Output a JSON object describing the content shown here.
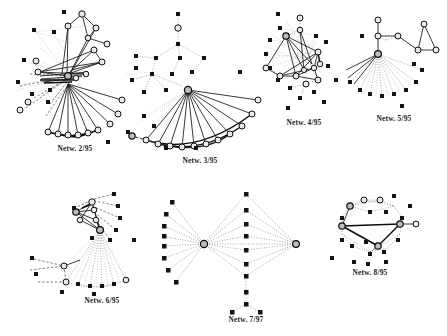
{
  "figure": {
    "background": "#ffffff",
    "ink": "#141414",
    "panel_count": 8
  },
  "panels": [
    {
      "id": "netw-2-95",
      "caption": "Netw. 2/95",
      "description": "Dense hub-and-spoke sociogram with a central cluster and a large fan of solid edges to an arc of circle nodes at lower right.",
      "circle_nodes": 27,
      "square_nodes": 14,
      "dominant_edge_style": "solid"
    },
    {
      "id": "netw-3-95",
      "caption": "Netw. 3/95",
      "description": "Single strong hub emitting a wide fan of solid edges to a lower arc of circle nodes, plus a sparse dotted tree above.",
      "circle_nodes": 20,
      "square_nodes": 15,
      "dominant_edge_style": "solid"
    },
    {
      "id": "netw-4-95",
      "caption": "Netw. 4/95",
      "description": "Compact circular cluster with criss-crossing solid edges surrounded by a halo of faint dotted links and square nodes.",
      "circle_nodes": 12,
      "square_nodes": 16,
      "dominant_edge_style": "mixed"
    },
    {
      "id": "netw-5-95",
      "caption": "Netw. 5/95",
      "description": "Hub with a dotted fan spreading downward, a short vertical chain above, and a small triangular clique at the upper right.",
      "circle_nodes": 9,
      "square_nodes": 13,
      "dominant_edge_style": "dotted"
    },
    {
      "id": "netw-6-95",
      "caption": "Netw. 6/95",
      "description": "Tight upper cluster of circle nodes joined by solid edges, with long dotted fans descending to a lower arc of square nodes.",
      "circle_nodes": 8,
      "square_nodes": 18,
      "dominant_edge_style": "dotted"
    },
    {
      "id": "netw-7-97",
      "caption": "Netw. 7/97",
      "description": "Butterfly / bipartite layout: two hubs linked by a long dotted edge, each radiating dotted spokes to columns of square nodes.",
      "circle_nodes": 2,
      "square_nodes": 22,
      "dominant_edge_style": "dotted"
    },
    {
      "id": "netw-8-95",
      "caption": "Netw. 8/95",
      "description": "Ring of square nodes enclosing a triangular solid-line core connecting four circle nodes.",
      "circle_nodes": 6,
      "square_nodes": 16,
      "dominant_edge_style": "mixed"
    }
  ],
  "captions": {
    "n2": "Netw. 2/95",
    "n3": "Netw. 3/95",
    "n4": "Netw. 4/95",
    "n5": "Netw. 5/95",
    "n6": "Netw. 6/95",
    "n7": "Netw. 7/97",
    "n8": "Netw. 8/95"
  }
}
